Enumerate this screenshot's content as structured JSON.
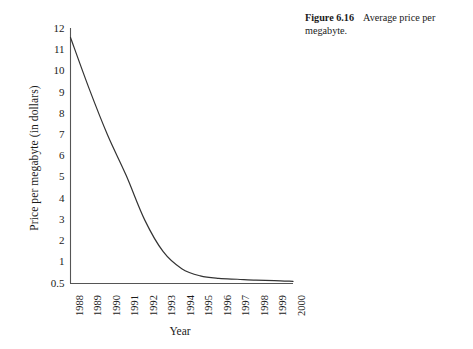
{
  "caption": {
    "figure_number": "Figure 6.16",
    "text": "Average price per megabyte."
  },
  "chart_data": {
    "type": "line",
    "title": "",
    "xlabel": "Year",
    "ylabel": "Price per megabyte (in dollars)",
    "x": [
      "1988",
      "1989",
      "1990",
      "1991",
      "1992",
      "1993",
      "1994",
      "1995",
      "1996",
      "1997",
      "1998",
      "1999",
      "2000"
    ],
    "categories": [
      "1988",
      "1989",
      "1990",
      "1991",
      "1992",
      "1993",
      "1994",
      "1995",
      "1996",
      "1997",
      "1998",
      "1999",
      "2000"
    ],
    "values": [
      11.6,
      9.2,
      7.0,
      5.1,
      3.0,
      1.5,
      0.85,
      0.68,
      0.62,
      0.6,
      0.58,
      0.57,
      0.55
    ],
    "series": [
      {
        "name": "Average price per megabyte",
        "values": [
          11.6,
          9.2,
          7.0,
          5.1,
          3.0,
          1.5,
          0.85,
          0.68,
          0.62,
          0.6,
          0.58,
          0.57,
          0.55
        ]
      }
    ],
    "ylim": [
      0.5,
      12
    ],
    "xlim": [
      "1988",
      "2000"
    ],
    "yticks": [
      "0.5",
      "1",
      "2",
      "3",
      "4",
      "5",
      "6",
      "7",
      "8",
      "9",
      "10",
      "11",
      "12"
    ],
    "ytick_values": [
      0.5,
      1,
      2,
      3,
      4,
      5,
      6,
      7,
      8,
      9,
      10,
      11,
      12
    ],
    "xticks": [
      "1988",
      "1989",
      "1990",
      "1991",
      "1992",
      "1993",
      "1994",
      "1995",
      "1996",
      "1997",
      "1998",
      "1999",
      "2000"
    ],
    "grid": false,
    "legend": false,
    "legend_position": "none",
    "line_color": "#333333",
    "axis_color": "#555555",
    "xtick_rotation": 90
  }
}
